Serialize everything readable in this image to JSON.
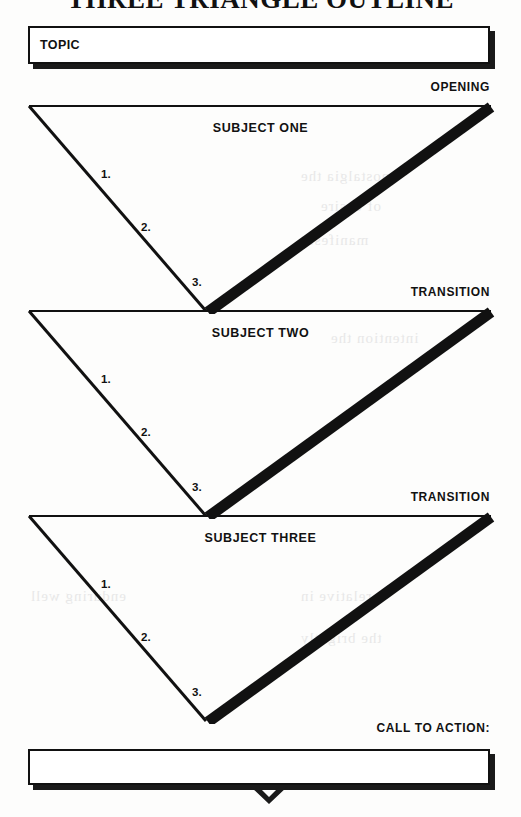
{
  "document": {
    "title": "THREE TRIANGLE OUTLINE"
  },
  "topic_box": {
    "label": "TOPIC"
  },
  "sections": [
    {
      "marker": "OPENING",
      "subject": "SUBJECT ONE",
      "points": [
        "1.",
        "2.",
        "3."
      ]
    },
    {
      "marker": "TRANSITION",
      "subject": "SUBJECT TWO",
      "points": [
        "1.",
        "2.",
        "3."
      ]
    },
    {
      "marker": "TRANSITION",
      "subject": "SUBJECT THREE",
      "points": [
        "1.",
        "2.",
        "3."
      ]
    }
  ],
  "call_to_action": {
    "marker": "CALL TO ACTION:",
    "box_label": ""
  },
  "style": {
    "ink": "#111111",
    "paper": "#fdfdfc",
    "shadow": "#1a1a1a"
  },
  "background_bleed": [
    "nostalgia the",
    "of desire",
    "manifesto",
    "intention the",
    "enduring well",
    "relative in",
    "the brightly"
  ]
}
